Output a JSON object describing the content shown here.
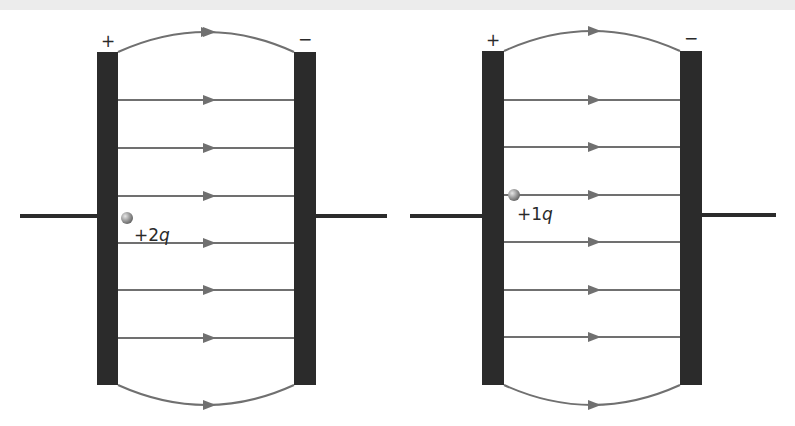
{
  "figure": {
    "colors": {
      "plate": "#2b2b2b",
      "field_line": "#707070",
      "lead": "#2b2b2b",
      "charge_fill": "#9a9a9a",
      "text": "#2a2a2a"
    }
  },
  "capacitors": [
    {
      "id": "left",
      "positive_label": "+",
      "negative_label": "−",
      "charge_label": "+2q",
      "charge_value": "+2",
      "charge_unit": "q"
    },
    {
      "id": "right",
      "positive_label": "+",
      "negative_label": "−",
      "charge_label": "+1q",
      "charge_value": "+1",
      "charge_unit": "q"
    }
  ]
}
